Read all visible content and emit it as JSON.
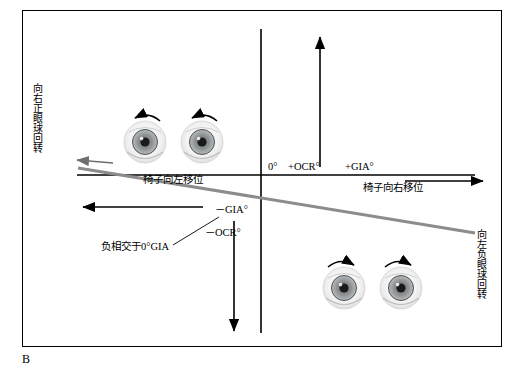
{
  "figure": {
    "panel_letter": "B",
    "labels": {
      "y_top": "向右正眼球回转",
      "y_bottom": "向左负眼球回转",
      "chair_left": "椅子向左移位",
      "chair_right": "椅子向右移位",
      "origin": "0°",
      "plus_ocr": "+OCR°",
      "plus_gia": "+GIA°",
      "minus_gia": "－GIA°",
      "minus_ocr": "－OCR°",
      "negative_correlation": "负相交于0°GIA"
    },
    "colors": {
      "axis": "#000000",
      "diagonal": "#808080",
      "border": "#000000",
      "background": "#ffffff"
    },
    "eyes": {
      "top_pair_rotation": "counter-clockwise-arrow",
      "bottom_pair_rotation": "clockwise-arrow",
      "count_top": 2,
      "count_bottom": 2
    }
  }
}
